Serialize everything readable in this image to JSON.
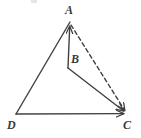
{
  "figure": {
    "kind": "geometry-vector-diagram",
    "width": 141,
    "height": 138,
    "background_color": "#ffffff",
    "stroke_color": "#404040",
    "label_color": "#3a3a3a",
    "stroke_width": 1.4,
    "dash_pattern": "4 3"
  },
  "labels": {
    "A": "A",
    "B": "B",
    "C": "C",
    "D": "D"
  },
  "points": {
    "A": {
      "x": 70,
      "y": 22,
      "label": "A",
      "label_position": "above"
    },
    "B": {
      "x": 68,
      "y": 68,
      "label": "B",
      "label_position": "right"
    },
    "C": {
      "x": 127,
      "y": 114,
      "label": "C",
      "label_position": "below-right"
    },
    "D": {
      "x": 16,
      "y": 114,
      "label": "D",
      "label_position": "below-left"
    }
  },
  "segments": [
    {
      "name": "D-to-A",
      "from": "D",
      "to": "A",
      "style": "solid",
      "arrow_at_end": false
    },
    {
      "name": "D-to-C",
      "from": "D",
      "to": "C",
      "style": "solid",
      "arrow_at_end": true
    },
    {
      "name": "B-to-A",
      "from": "B",
      "to": "A",
      "style": "solid",
      "arrow_at_end": true
    },
    {
      "name": "B-to-C",
      "from": "B",
      "to": "C",
      "style": "solid",
      "arrow_at_end": true
    },
    {
      "name": "A-to-C",
      "from": "A",
      "to": "C",
      "style": "dashed",
      "arrow_at_end": true
    }
  ]
}
